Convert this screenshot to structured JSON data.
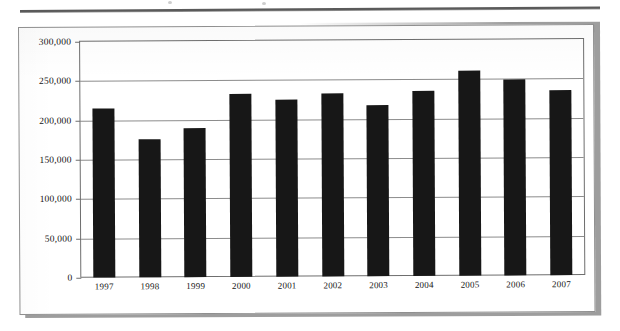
{
  "chart_data": {
    "type": "bar",
    "title": "",
    "subtitle": "",
    "xlabel": "",
    "ylabel": "",
    "categories": [
      "1997",
      "1998",
      "1999",
      "2000",
      "2001",
      "2002",
      "2003",
      "2004",
      "2005",
      "2006",
      "2007"
    ],
    "values": [
      215000,
      175000,
      190000,
      233000,
      225000,
      233000,
      218000,
      235000,
      260000,
      249000,
      235000
    ],
    "series": [
      {
        "name": "",
        "values": [
          215000,
          175000,
          190000,
          233000,
          225000,
          233000,
          218000,
          235000,
          260000,
          249000,
          235000
        ]
      }
    ],
    "ylim": [
      0,
      300000
    ],
    "ytick_values": [
      0,
      50000,
      100000,
      150000,
      200000,
      250000,
      300000
    ],
    "ytick_labels": [
      "0",
      "50,000",
      "100,000",
      "150,000",
      "200,000",
      "250,000",
      "300,000"
    ],
    "grid": "horizontal",
    "legend": "none",
    "bar_color": "#171717",
    "gridline_color": "#8c8c8c",
    "axis_color": "#6e6e6e",
    "background_color": "#ffffff"
  },
  "figure": {
    "frame_border_color": "#8f8f8f",
    "shadow_color": "#9d9d9d"
  }
}
